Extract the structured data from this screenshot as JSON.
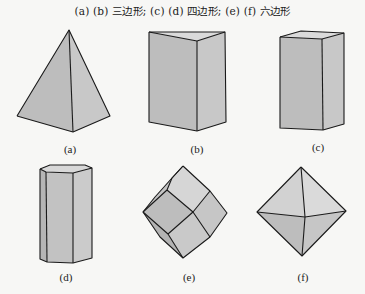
{
  "title": "(a) (b) 三边形; (c) (d) 四边形; (e) (f) 六边形",
  "colors": {
    "background": "#f7f7f5",
    "face_dark": "#b9b9b9",
    "face_mid": "#c6c6c6",
    "face_light": "#d4d4d4",
    "edge": "#1a1a1a"
  },
  "figures": [
    {
      "id": "a",
      "label": "(a)",
      "shape": "triangular-pyramid"
    },
    {
      "id": "b",
      "label": "(b)",
      "shape": "triangular-prism"
    },
    {
      "id": "c",
      "label": "(c)",
      "shape": "rectangular-prism"
    },
    {
      "id": "d",
      "label": "(d)",
      "shape": "hexagonal-prism"
    },
    {
      "id": "e",
      "label": "(e)",
      "shape": "rhombic-dodecahedron"
    },
    {
      "id": "f",
      "label": "(f)",
      "shape": "octahedron"
    }
  ]
}
